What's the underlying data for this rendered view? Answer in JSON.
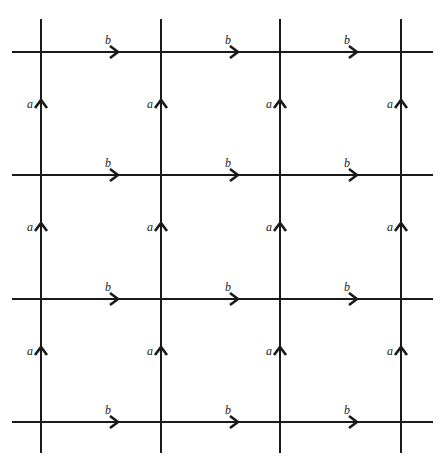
{
  "diagram": {
    "stroke_color": "#1a1a1a",
    "background": "#ffffff",
    "columns_x": [
      41,
      161,
      280,
      401
    ],
    "rows_y": [
      52,
      175,
      299,
      422
    ],
    "h_line_extent": [
      12,
      433
    ],
    "v_line_extent": [
      19,
      453
    ],
    "horizontal_label": "b",
    "vertical_label": "a",
    "h_arrows": [
      {
        "x": 118,
        "y": 52,
        "label": "b"
      },
      {
        "x": 238,
        "y": 52,
        "label": "b"
      },
      {
        "x": 357,
        "y": 52,
        "label": "b"
      },
      {
        "x": 118,
        "y": 175,
        "label": "b"
      },
      {
        "x": 238,
        "y": 175,
        "label": "b"
      },
      {
        "x": 357,
        "y": 175,
        "label": "b"
      },
      {
        "x": 118,
        "y": 299,
        "label": "b"
      },
      {
        "x": 238,
        "y": 299,
        "label": "b"
      },
      {
        "x": 357,
        "y": 299,
        "label": "b"
      },
      {
        "x": 118,
        "y": 422,
        "label": "b"
      },
      {
        "x": 238,
        "y": 422,
        "label": "b"
      },
      {
        "x": 357,
        "y": 422,
        "label": "b"
      }
    ],
    "v_arrows": [
      {
        "x": 41,
        "y": 100,
        "label": "a"
      },
      {
        "x": 161,
        "y": 100,
        "label": "a"
      },
      {
        "x": 280,
        "y": 100,
        "label": "a"
      },
      {
        "x": 401,
        "y": 100,
        "label": "a"
      },
      {
        "x": 41,
        "y": 223,
        "label": "a"
      },
      {
        "x": 161,
        "y": 223,
        "label": "a"
      },
      {
        "x": 280,
        "y": 223,
        "label": "a"
      },
      {
        "x": 401,
        "y": 223,
        "label": "a"
      },
      {
        "x": 41,
        "y": 347,
        "label": "a"
      },
      {
        "x": 161,
        "y": 347,
        "label": "a"
      },
      {
        "x": 280,
        "y": 347,
        "label": "a"
      },
      {
        "x": 401,
        "y": 347,
        "label": "a"
      }
    ]
  }
}
